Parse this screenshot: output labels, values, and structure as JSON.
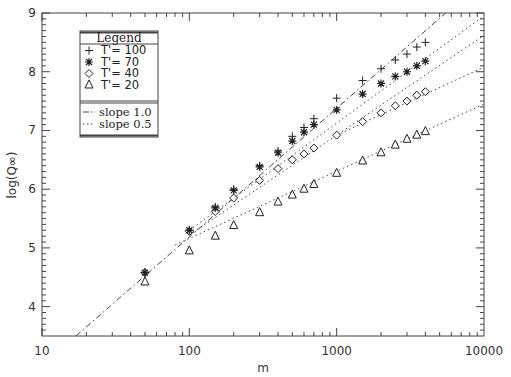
{
  "chart_data": {
    "type": "scatter",
    "title": "",
    "xlabel": "m",
    "ylabel": "log(Q∞)",
    "xscale": "log",
    "xlim": [
      10,
      10000
    ],
    "ylim": [
      3.5,
      9
    ],
    "xticks": [
      10,
      100,
      1000,
      10000
    ],
    "xtick_labels": [
      "10",
      "100",
      "1000",
      "10000"
    ],
    "yticks": [
      4,
      5,
      6,
      7,
      8,
      9
    ],
    "ytick_labels": [
      "4",
      "5",
      "6",
      "7",
      "8",
      "9"
    ],
    "grid": false,
    "legend_position": "upper-left",
    "x": [
      50,
      100,
      150,
      200,
      300,
      400,
      500,
      600,
      700,
      1000,
      1500,
      2000,
      2500,
      3000,
      3500,
      4000
    ],
    "series": [
      {
        "name": "T'= 100",
        "marker": "plus",
        "values": [
          4.58,
          5.3,
          5.7,
          6.0,
          6.4,
          6.65,
          6.9,
          7.05,
          7.2,
          7.55,
          7.85,
          8.05,
          8.2,
          8.3,
          8.42,
          8.5
        ]
      },
      {
        "name": "T'= 70",
        "marker": "asterisk",
        "values": [
          4.58,
          5.3,
          5.68,
          5.98,
          6.38,
          6.62,
          6.82,
          6.97,
          7.1,
          7.35,
          7.62,
          7.8,
          7.92,
          8.0,
          8.1,
          8.18
        ]
      },
      {
        "name": "T'= 40",
        "marker": "diamond",
        "values": [
          4.58,
          5.28,
          5.62,
          5.85,
          6.15,
          6.35,
          6.5,
          6.6,
          6.7,
          6.92,
          7.15,
          7.3,
          7.42,
          7.5,
          7.6,
          7.66
        ]
      },
      {
        "name": "T'= 20",
        "marker": "triangle",
        "values": [
          4.42,
          4.95,
          5.2,
          5.38,
          5.6,
          5.78,
          5.9,
          6.0,
          6.08,
          6.27,
          6.48,
          6.62,
          6.75,
          6.85,
          6.92,
          6.98
        ]
      }
    ],
    "reference_lines": [
      {
        "name": "slope 1.0",
        "style": "dash-dot",
        "points": [
          [
            17,
            3.5
          ],
          [
            5500,
            9.0
          ]
        ]
      },
      {
        "name": "slope 0.5",
        "style": "dotted",
        "points": [
          [
            100,
            5.22
          ],
          [
            10000,
            8.62
          ]
        ]
      },
      {
        "name": "slope 0.5",
        "style": "dotted",
        "points": [
          [
            100,
            5.3
          ],
          [
            10000,
            8.95
          ]
        ]
      },
      {
        "name": "slope 0.5",
        "style": "dotted",
        "points": [
          [
            1000,
            6.92
          ],
          [
            10000,
            8.08
          ]
        ]
      },
      {
        "name": "slope 0.5",
        "style": "dotted",
        "points": [
          [
            80,
            5.05
          ],
          [
            10000,
            7.45
          ]
        ]
      }
    ]
  },
  "legend": {
    "title": "Legend",
    "entries": [
      {
        "symbol": "+",
        "label": "T'= 100"
      },
      {
        "symbol": "✱",
        "label": "T'= 70"
      },
      {
        "symbol": "◇",
        "label": "T'= 40"
      },
      {
        "symbol": "△",
        "label": "T'= 20"
      }
    ],
    "lines": [
      {
        "symbol": "-·",
        "label": "slope 1.0"
      },
      {
        "symbol": "···",
        "label": "slope 0.5"
      }
    ]
  },
  "axes": {
    "xlabel": "m",
    "ylabel": "log(Q∞)"
  }
}
